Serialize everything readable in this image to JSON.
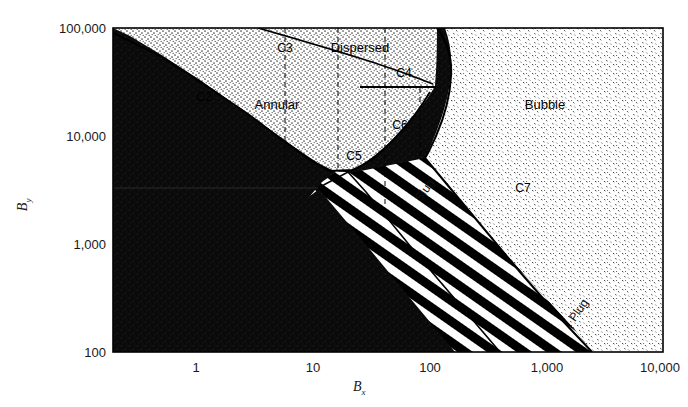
{
  "figure": {
    "kind": "flow-regime-map",
    "background_color": "#ffffff",
    "frame_color": "#000000"
  },
  "axes": {
    "x": {
      "title": "B",
      "title_sub": "x",
      "scale": "log",
      "min": 0.2,
      "max": 10000,
      "ticks": [
        {
          "value": 1,
          "label": "1"
        },
        {
          "value": 10,
          "label": "10"
        },
        {
          "value": 100,
          "label": "100"
        },
        {
          "value": 1000,
          "label": "1,000"
        },
        {
          "value": 10000,
          "label": "10,000"
        }
      ]
    },
    "y": {
      "title": "B",
      "title_sub": "y",
      "scale": "log",
      "min": 100,
      "max": 100000,
      "ticks": [
        {
          "value": 100,
          "label": "100"
        },
        {
          "value": 1000,
          "label": "1,000"
        },
        {
          "value": 10000,
          "label": "10,000"
        },
        {
          "value": 100000,
          "label": "100,000"
        }
      ]
    }
  },
  "regions": [
    {
      "name": "Annular",
      "label": "Annular",
      "x_px": 277,
      "y_px": 104,
      "fill": "stipple-light"
    },
    {
      "name": "Dispersed",
      "label": "Dispersed",
      "x_px": 360,
      "y_px": 47,
      "fill": "stipple-light"
    },
    {
      "name": "Bubble",
      "label": "Bubble",
      "x_px": 545,
      "y_px": 104,
      "fill": "stipple-sparse"
    },
    {
      "name": "Slug",
      "label": "Slug",
      "x_px": 418,
      "y_px": 200,
      "rotation": -55,
      "fill": "diagonal-hatch"
    },
    {
      "name": "Plug",
      "label": "Plug",
      "x_px": 570,
      "y_px": 320,
      "rotation": -55,
      "fill": "diagonal-hatch"
    },
    {
      "name": "Stratified-Wave",
      "label": "",
      "x_px": 250,
      "y_px": 280,
      "fill": "solid-dark"
    }
  ],
  "curve_labels": [
    {
      "name": "C2",
      "label": "C2",
      "x_px": 204,
      "y_px": 97
    },
    {
      "name": "C3",
      "label": "C3",
      "x_px": 285,
      "y_px": 48
    },
    {
      "name": "C4",
      "label": "C4",
      "x_px": 404,
      "y_px": 73
    },
    {
      "name": "C5",
      "label": "C5",
      "x_px": 354,
      "y_px": 156
    },
    {
      "name": "C6",
      "label": "C6",
      "x_px": 400,
      "y_px": 125
    },
    {
      "name": "C7",
      "label": "C7",
      "x_px": 523,
      "y_px": 188
    }
  ],
  "plot_area": {
    "left_px": 113,
    "top_px": 28,
    "right_px": 663,
    "bottom_px": 352
  }
}
